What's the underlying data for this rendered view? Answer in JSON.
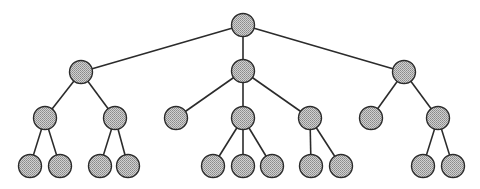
{
  "diagram": {
    "type": "tree",
    "colors": {
      "background": "#ffffff",
      "edge": "#2b2b2b",
      "node_outline": "#2b2b2b",
      "node_fill_light": "#d0d0d0",
      "node_fill_dark": "#8a8a8a"
    },
    "node_radius": 11.5,
    "nodes": [
      {
        "id": "n0",
        "x": 243,
        "y": 25,
        "level": 0
      },
      {
        "id": "n1",
        "x": 81,
        "y": 72,
        "level": 1
      },
      {
        "id": "n2",
        "x": 243,
        "y": 71,
        "level": 1
      },
      {
        "id": "n3",
        "x": 404,
        "y": 72,
        "level": 1
      },
      {
        "id": "n4",
        "x": 45,
        "y": 118,
        "level": 2
      },
      {
        "id": "n5",
        "x": 115,
        "y": 118,
        "level": 2
      },
      {
        "id": "n6",
        "x": 176,
        "y": 118,
        "level": 2
      },
      {
        "id": "n7",
        "x": 243,
        "y": 118,
        "level": 2
      },
      {
        "id": "n8",
        "x": 310,
        "y": 118,
        "level": 2
      },
      {
        "id": "n9",
        "x": 371,
        "y": 118,
        "level": 2
      },
      {
        "id": "n10",
        "x": 438,
        "y": 118,
        "level": 2
      },
      {
        "id": "n11",
        "x": 30,
        "y": 166,
        "level": 3
      },
      {
        "id": "n12",
        "x": 60,
        "y": 166,
        "level": 3
      },
      {
        "id": "n13",
        "x": 100,
        "y": 166,
        "level": 3
      },
      {
        "id": "n14",
        "x": 128,
        "y": 166,
        "level": 3
      },
      {
        "id": "n15",
        "x": 213,
        "y": 166,
        "level": 3
      },
      {
        "id": "n16",
        "x": 243,
        "y": 166,
        "level": 3
      },
      {
        "id": "n17",
        "x": 272,
        "y": 166,
        "level": 3
      },
      {
        "id": "n18",
        "x": 311,
        "y": 166,
        "level": 3
      },
      {
        "id": "n19",
        "x": 341,
        "y": 166,
        "level": 3
      },
      {
        "id": "n20",
        "x": 423,
        "y": 166,
        "level": 3
      },
      {
        "id": "n21",
        "x": 453,
        "y": 166,
        "level": 3
      }
    ],
    "edges": [
      [
        "n0",
        "n1"
      ],
      [
        "n0",
        "n2"
      ],
      [
        "n0",
        "n3"
      ],
      [
        "n1",
        "n4"
      ],
      [
        "n1",
        "n5"
      ],
      [
        "n2",
        "n6"
      ],
      [
        "n2",
        "n7"
      ],
      [
        "n2",
        "n8"
      ],
      [
        "n3",
        "n9"
      ],
      [
        "n3",
        "n10"
      ],
      [
        "n4",
        "n11"
      ],
      [
        "n4",
        "n12"
      ],
      [
        "n5",
        "n13"
      ],
      [
        "n5",
        "n14"
      ],
      [
        "n7",
        "n15"
      ],
      [
        "n7",
        "n16"
      ],
      [
        "n7",
        "n17"
      ],
      [
        "n8",
        "n18"
      ],
      [
        "n8",
        "n19"
      ],
      [
        "n10",
        "n20"
      ],
      [
        "n10",
        "n21"
      ]
    ]
  }
}
